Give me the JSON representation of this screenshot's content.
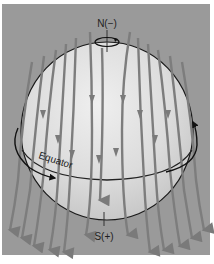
{
  "figure": {
    "labels": {
      "north": "N(−)",
      "south": "S(+)",
      "equator": "Equator"
    },
    "colors": {
      "background": "#9a9a9a",
      "sphere_fill": "#d8d8d8",
      "sphere_highlight": "#ededed",
      "outline": "#1a1a1a",
      "field_lines": "#7d7d7d",
      "rotation_arrow": "#111111"
    },
    "icons": {
      "north_rotation": "rotation-arrow-icon",
      "equator_rotation": "rotation-arrow-icon",
      "field_line_arrows": "arrow-down-icon"
    },
    "field_line_count": 14
  }
}
